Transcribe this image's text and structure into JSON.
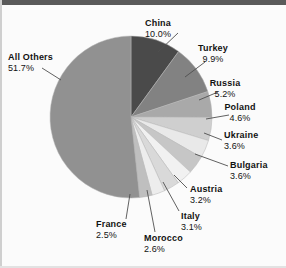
{
  "chart_data": {
    "type": "pie",
    "title": "",
    "subtitle": "",
    "xlabel": "",
    "ylabel": "",
    "legend_position": "callout-labels",
    "grid": false,
    "unit": "%",
    "total": 100.0,
    "start_angle_deg": 0,
    "direction": "clockwise",
    "categories": [
      "China",
      "Turkey",
      "Russia",
      "Poland",
      "Ukraine",
      "Bulgaria",
      "Austria",
      "Italy",
      "Morocco",
      "France",
      "All Others"
    ],
    "values": [
      10.0,
      9.9,
      5.2,
      4.6,
      3.6,
      3.6,
      3.2,
      3.1,
      2.6,
      2.5,
      51.7
    ],
    "slices": [
      {
        "label": "China",
        "value": 10.0,
        "value_text": "10.0%",
        "color": "#4a4a4a"
      },
      {
        "label": "Turkey",
        "value": 9.9,
        "value_text": "9.9%",
        "color": "#828282"
      },
      {
        "label": "Russia",
        "value": 5.2,
        "value_text": "5.2%",
        "color": "#a9a9a9"
      },
      {
        "label": "Poland",
        "value": 4.6,
        "value_text": "4.6%",
        "color": "#cfcfcf"
      },
      {
        "label": "Ukraine",
        "value": 3.6,
        "value_text": "3.6%",
        "color": "#e9e9e9"
      },
      {
        "label": "Bulgaria",
        "value": 3.6,
        "value_text": "3.6%",
        "color": "#c6c6c6"
      },
      {
        "label": "Austria",
        "value": 3.2,
        "value_text": "3.2%",
        "color": "#f1f1f1"
      },
      {
        "label": "Italy",
        "value": 3.1,
        "value_text": "3.1%",
        "color": "#d9d9d9"
      },
      {
        "label": "Morocco",
        "value": 2.6,
        "value_text": "2.6%",
        "color": "#ededed"
      },
      {
        "label": "France",
        "value": 2.5,
        "value_text": "2.5%",
        "color": "#bfbfbf"
      },
      {
        "label": "All Others",
        "value": 51.7,
        "value_text": "51.7%",
        "color": "#919191"
      }
    ]
  },
  "labels": {
    "china": {
      "name": "China",
      "pct": "10.0%"
    },
    "turkey": {
      "name": "Turkey",
      "pct": "9.9%"
    },
    "russia": {
      "name": "Russia",
      "pct": "5.2%"
    },
    "poland": {
      "name": "Poland",
      "pct": "4.6%"
    },
    "ukraine": {
      "name": "Ukraine",
      "pct": "3.6%"
    },
    "bulgaria": {
      "name": "Bulgaria",
      "pct": "3.6%"
    },
    "austria": {
      "name": "Austria",
      "pct": "3.2%"
    },
    "italy": {
      "name": "Italy",
      "pct": "3.1%"
    },
    "morocco": {
      "name": "Morocco",
      "pct": "2.6%"
    },
    "france": {
      "name": "France",
      "pct": "2.5%"
    },
    "all_others": {
      "name": "All Others",
      "pct": "51.7%"
    }
  },
  "geometry": {
    "center_x": 131,
    "center_y": 117,
    "radius": 81
  },
  "colors": {
    "background": "#fbfbfb",
    "frame_top": "#5a5a5a",
    "text": "#121212",
    "leader_line": "#4f4f4f",
    "slice_edge": "#b4b4b4"
  }
}
